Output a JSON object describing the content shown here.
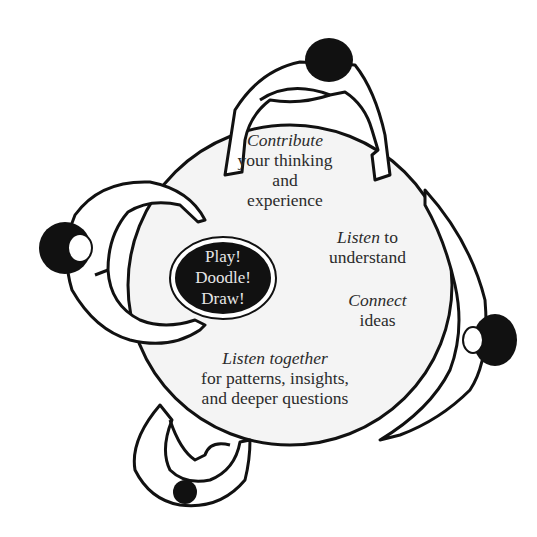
{
  "center_oval": {
    "lines": [
      "Play!",
      "Doodle!",
      "Draw!"
    ],
    "fill": "#111111",
    "text_color": "#e6e6e6"
  },
  "labels": {
    "contribute": {
      "emph": "Contribute",
      "line2": "your thinking",
      "line3": "and",
      "line4": "experience"
    },
    "listen": {
      "emph": "Listen",
      "rest": " to",
      "line2": "understand"
    },
    "connect": {
      "emph": "Connect",
      "line2": "ideas"
    },
    "listen_together": {
      "emph": "Listen together",
      "line2": "for patterns, insights,",
      "line3": "and deeper questions"
    }
  },
  "figures": [
    "person-top",
    "person-left",
    "person-right",
    "person-bottom"
  ],
  "colors": {
    "table_fill": "#f4f4f4",
    "outline": "#111111",
    "background": "#ffffff"
  }
}
